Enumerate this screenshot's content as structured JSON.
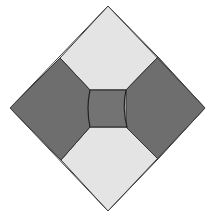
{
  "diagram": {
    "title": "",
    "shape": "diamond quilt block",
    "colors": {
      "light": "#e4e4e4",
      "dark": "#6e6e6e",
      "center": "#737373",
      "stroke": "#333333",
      "background": "#ffffff"
    },
    "regions": [
      {
        "name": "top-light-panel",
        "fill": "light"
      },
      {
        "name": "bottom-light-panel",
        "fill": "light"
      },
      {
        "name": "left-dark-panel",
        "fill": "dark"
      },
      {
        "name": "right-dark-panel",
        "fill": "dark"
      },
      {
        "name": "center-square",
        "fill": "center"
      }
    ]
  }
}
